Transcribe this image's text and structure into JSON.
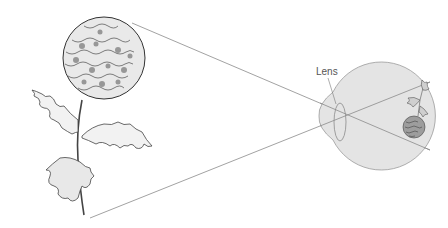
{
  "diagram": {
    "labels": {
      "lens": "Lens"
    },
    "colors": {
      "eye_fill": "#e4e4e4",
      "eye_stroke": "#9a9a9a",
      "line": "#8a8a8a",
      "ink": "#444444"
    },
    "objects": [
      {
        "id": "flower",
        "desc": "Chrysanthemum plant drawing (object)"
      },
      {
        "id": "eye",
        "desc": "Eyeball cross-section with lens"
      },
      {
        "id": "retinal-image",
        "desc": "Inverted image of the flower on the retina"
      }
    ]
  }
}
